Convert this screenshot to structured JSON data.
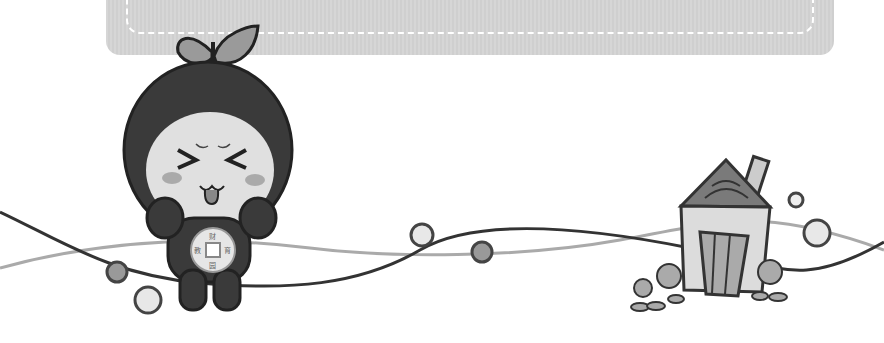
{
  "scene": {
    "type": "decorative-illustration",
    "banner": {
      "color": "#d3d3d3",
      "dash_color": "#ffffff"
    },
    "mascot": {
      "name": "leaf-head mascot",
      "expression": ">< tongue out",
      "coin_chars": {
        "top": "财",
        "left": "教",
        "right": "育",
        "bottom": "园"
      }
    },
    "house": {
      "label": ""
    },
    "colors": {
      "dark": "#333333",
      "mid": "#8a8a8a",
      "light": "#e2e2e2",
      "line_light": "#aaaaaa"
    }
  }
}
